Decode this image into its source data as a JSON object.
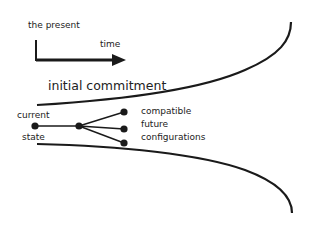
{
  "labels": {
    "present": "the present",
    "time": "time",
    "commitment": "initial commitment",
    "current_line1": "current",
    "current_line2": "state",
    "future_line1": "compatible",
    "future_line2": "future",
    "future_line3": "configurations"
  },
  "colors": {
    "stroke": "#1a1a1a",
    "text": "#222222",
    "background": "#ffffff"
  }
}
